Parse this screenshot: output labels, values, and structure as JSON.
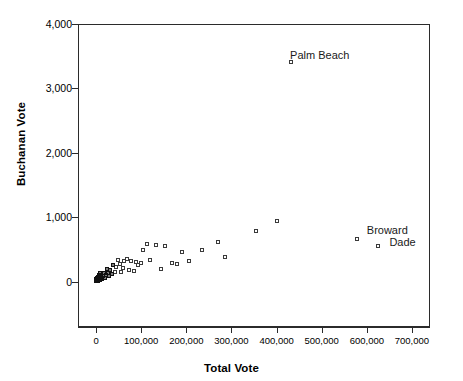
{
  "chart_data": {
    "type": "scatter",
    "title": "",
    "xlabel": "Total Vote",
    "ylabel": "Buchanan Vote",
    "xlim": [
      -40000,
      740000
    ],
    "ylim": [
      -700,
      4000
    ],
    "grid": false,
    "legend": null,
    "xticks": [
      0,
      100000,
      200000,
      300000,
      400000,
      500000,
      600000,
      700000
    ],
    "xticklabels": [
      "0",
      "100,000",
      "200,000",
      "300,000",
      "400,000",
      "500,000",
      "600,000",
      "700,000"
    ],
    "yticks": [
      0,
      1000,
      2000,
      3000,
      4000
    ],
    "yticklabels": [
      "0",
      "1,000",
      "2,000",
      "3,000",
      "4,000"
    ],
    "marker": "open-square",
    "annotations": [
      {
        "text": "Palm Beach",
        "x": 430000,
        "y": 3600
      },
      {
        "text": "Broward",
        "x": 600000,
        "y": 880
      },
      {
        "text": "Dade",
        "x": 650000,
        "y": 700
      }
    ],
    "points": [
      {
        "x": 431621,
        "y": 3407,
        "label": "Palm Beach"
      },
      {
        "x": 577200,
        "y": 670,
        "label": "Broward"
      },
      {
        "x": 625000,
        "y": 560,
        "label": "Dade"
      },
      {
        "x": 355000,
        "y": 790,
        "label": ""
      },
      {
        "x": 400000,
        "y": 950,
        "label": ""
      },
      {
        "x": 270000,
        "y": 620,
        "label": ""
      },
      {
        "x": 285000,
        "y": 390,
        "label": ""
      },
      {
        "x": 235000,
        "y": 500,
        "label": ""
      },
      {
        "x": 205000,
        "y": 330,
        "label": ""
      },
      {
        "x": 190000,
        "y": 470,
        "label": ""
      },
      {
        "x": 180000,
        "y": 275,
        "label": ""
      },
      {
        "x": 168000,
        "y": 290,
        "label": ""
      },
      {
        "x": 152000,
        "y": 560,
        "label": ""
      },
      {
        "x": 144000,
        "y": 200,
        "label": ""
      },
      {
        "x": 132000,
        "y": 570,
        "label": ""
      },
      {
        "x": 120000,
        "y": 335,
        "label": ""
      },
      {
        "x": 112000,
        "y": 590,
        "label": ""
      },
      {
        "x": 104000,
        "y": 495,
        "label": ""
      },
      {
        "x": 100000,
        "y": 300,
        "label": ""
      },
      {
        "x": 94000,
        "y": 260,
        "label": ""
      },
      {
        "x": 88000,
        "y": 310,
        "label": ""
      },
      {
        "x": 84000,
        "y": 170,
        "label": ""
      },
      {
        "x": 78000,
        "y": 320,
        "label": ""
      },
      {
        "x": 72000,
        "y": 185,
        "label": ""
      },
      {
        "x": 68000,
        "y": 360,
        "label": ""
      },
      {
        "x": 63000,
        "y": 330,
        "label": ""
      },
      {
        "x": 60000,
        "y": 215,
        "label": ""
      },
      {
        "x": 56000,
        "y": 150,
        "label": ""
      },
      {
        "x": 52000,
        "y": 280,
        "label": ""
      },
      {
        "x": 48000,
        "y": 345,
        "label": ""
      },
      {
        "x": 45000,
        "y": 225,
        "label": ""
      },
      {
        "x": 42000,
        "y": 160,
        "label": ""
      },
      {
        "x": 38000,
        "y": 260,
        "label": ""
      },
      {
        "x": 35000,
        "y": 120,
        "label": ""
      },
      {
        "x": 32000,
        "y": 190,
        "label": ""
      },
      {
        "x": 29000,
        "y": 95,
        "label": ""
      },
      {
        "x": 26000,
        "y": 140,
        "label": ""
      },
      {
        "x": 24000,
        "y": 205,
        "label": ""
      },
      {
        "x": 21000,
        "y": 110,
        "label": ""
      },
      {
        "x": 19000,
        "y": 60,
        "label": ""
      },
      {
        "x": 17000,
        "y": 145,
        "label": ""
      },
      {
        "x": 15000,
        "y": 85,
        "label": ""
      },
      {
        "x": 13000,
        "y": 40,
        "label": ""
      },
      {
        "x": 12000,
        "y": 105,
        "label": ""
      },
      {
        "x": 10500,
        "y": 65,
        "label": ""
      },
      {
        "x": 9500,
        "y": 130,
        "label": ""
      },
      {
        "x": 8500,
        "y": 30,
        "label": ""
      },
      {
        "x": 7500,
        "y": 80,
        "label": ""
      },
      {
        "x": 6800,
        "y": 45,
        "label": ""
      },
      {
        "x": 6000,
        "y": 100,
        "label": ""
      },
      {
        "x": 5400,
        "y": 20,
        "label": ""
      },
      {
        "x": 4800,
        "y": 60,
        "label": ""
      },
      {
        "x": 4200,
        "y": 35,
        "label": ""
      },
      {
        "x": 3600,
        "y": 75,
        "label": ""
      },
      {
        "x": 3100,
        "y": 15,
        "label": ""
      },
      {
        "x": 2700,
        "y": 50,
        "label": ""
      },
      {
        "x": 2300,
        "y": 28,
        "label": ""
      },
      {
        "x": 1900,
        "y": 58,
        "label": ""
      },
      {
        "x": 1600,
        "y": 12,
        "label": ""
      },
      {
        "x": 1300,
        "y": 38,
        "label": ""
      },
      {
        "x": 1000,
        "y": 22,
        "label": ""
      },
      {
        "x": 800,
        "y": 48,
        "label": ""
      },
      {
        "x": 600,
        "y": 8,
        "label": ""
      },
      {
        "x": 400,
        "y": 30,
        "label": ""
      },
      {
        "x": 250,
        "y": 18,
        "label": ""
      }
    ]
  }
}
